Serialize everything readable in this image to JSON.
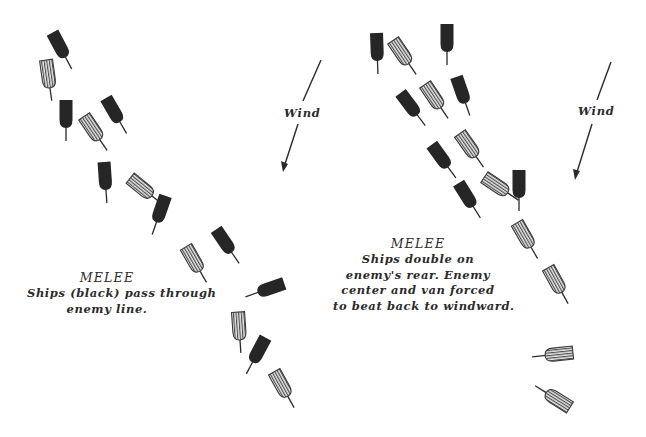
{
  "diagrams": [
    {
      "id": "left",
      "caption": {
        "title": "MELEE",
        "lines": [
          "Ships (black) pass through",
          "enemy line."
        ]
      },
      "wind_label": "Wind",
      "ships": [
        "black",
        "hatched",
        "black",
        "hatched",
        "black",
        "black",
        "hatched",
        "black",
        "hatched",
        "black",
        "black",
        "hatched",
        "black",
        "hatched"
      ]
    },
    {
      "id": "right",
      "caption": {
        "title": "MELEE",
        "lines": [
          "Ships double on",
          "enemy's rear. Enemy",
          "center and van forced",
          "to beat back to windward."
        ]
      },
      "wind_label": "Wind",
      "ships": [
        "black",
        "hatched",
        "black",
        "black",
        "hatched",
        "black",
        "black",
        "hatched",
        "black",
        "hatched",
        "black",
        "hatched",
        "hatched",
        "hatched",
        "hatched"
      ]
    }
  ],
  "legend": {
    "black": "Attacking fleet (black)",
    "hatched": "Enemy fleet"
  },
  "colors": {
    "black_ship": "#262626",
    "hatched_ship_fill": "#d8d8d8",
    "hatched_ship_stroke": "#3a3a3a",
    "ink": "#2a2a2a"
  }
}
